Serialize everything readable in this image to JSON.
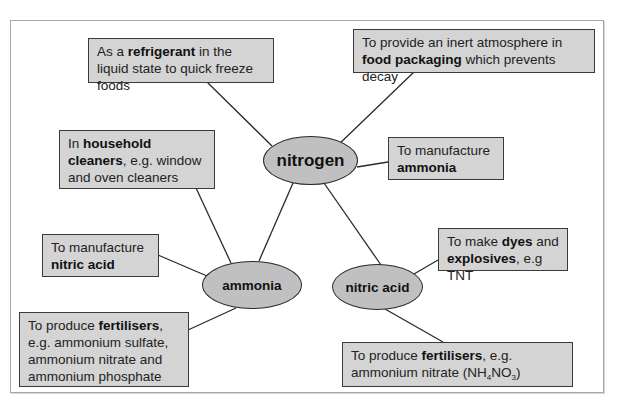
{
  "diagram": {
    "type": "mind-map",
    "colors": {
      "box_fill": "#d4d4d4",
      "node_fill": "#c0c0c0",
      "border": "#2a2a2a",
      "frame": "#a8a8a8"
    },
    "nodes": {
      "nitrogen": {
        "label": "nitrogen"
      },
      "ammonia": {
        "label": "ammonia"
      },
      "nitric_acid": {
        "label": "nitric acid"
      }
    },
    "boxes": {
      "refrigerant": {
        "parent": "nitrogen",
        "pre": "As a ",
        "bold": "refrigerant",
        "post": " in the liquid state to quick freeze foods"
      },
      "food_packaging": {
        "parent": "nitrogen",
        "pre": "To provide an inert atmosphere in ",
        "bold": "food packaging",
        "post": " which prevents decay"
      },
      "household_cleaners": {
        "parent": "nitrogen",
        "pre": "In ",
        "bold": "household cleaners",
        "post": ", e.g. window and oven cleaners"
      },
      "manufacture_ammonia": {
        "parent": "nitrogen",
        "pre": "To manufacture ",
        "bold": "ammonia",
        "post": ""
      },
      "manufacture_nitric_acid": {
        "parent": "ammonia",
        "pre": "To manufacture ",
        "bold": "nitric acid",
        "post": ""
      },
      "fertilisers_ammonia": {
        "parent": "ammonia",
        "pre": "To produce ",
        "bold": "fertilisers",
        "post": ", e.g. ammonium sulfate, ammonium nitrate and ammonium phosphate"
      },
      "dyes_explosives": {
        "parent": "nitric_acid",
        "pre": "To make ",
        "bold": "dyes",
        "mid": " and ",
        "bold2": "explosives",
        "post": ", e.g TNT"
      },
      "fertilisers_nitric": {
        "parent": "nitric_acid",
        "pre": "To produce ",
        "bold": "fertilisers",
        "post": ", e.g. ammonium nitrate (",
        "formula_a": "NH",
        "formula_sub1": "4",
        "formula_b": "NO",
        "formula_sub2": "3",
        "formula_end": ")"
      }
    },
    "edges": [
      [
        "nitrogen",
        "refrigerant"
      ],
      [
        "nitrogen",
        "food_packaging"
      ],
      [
        "nitrogen",
        "household_cleaners"
      ],
      [
        "nitrogen",
        "manufacture_ammonia"
      ],
      [
        "nitrogen",
        "ammonia"
      ],
      [
        "nitrogen",
        "nitric_acid"
      ],
      [
        "ammonia",
        "household_cleaners"
      ],
      [
        "ammonia",
        "manufacture_nitric_acid"
      ],
      [
        "ammonia",
        "fertilisers_ammonia"
      ],
      [
        "nitric_acid",
        "dyes_explosives"
      ],
      [
        "nitric_acid",
        "fertilisers_nitric"
      ]
    ]
  }
}
